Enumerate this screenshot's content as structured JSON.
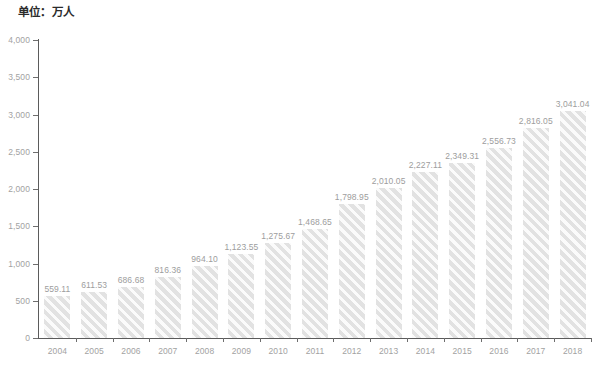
{
  "chart_data": {
    "type": "bar",
    "title": "单位：万人",
    "xlabel": "",
    "ylabel": "",
    "ylim": [
      0,
      4000
    ],
    "ytick_labels": [
      "4,000",
      "3,500",
      "3,000",
      "2,500",
      "2,000",
      "1,500",
      "1,000",
      "500",
      "0"
    ],
    "ytick_values": [
      4000,
      3500,
      3000,
      2500,
      2000,
      1500,
      1000,
      500,
      0
    ],
    "grid": false,
    "legend": null,
    "categories": [
      "2004",
      "2005",
      "2006",
      "2007",
      "2008",
      "2009",
      "2010",
      "2011",
      "2012",
      "2013",
      "2014",
      "2015",
      "2016",
      "2017",
      "2018"
    ],
    "values": [
      559.11,
      611.53,
      686.68,
      816.36,
      964.1,
      1123.55,
      1275.67,
      1468.65,
      1798.95,
      2010.05,
      2227.11,
      2349.31,
      2556.73,
      2816.05,
      3041.04
    ],
    "value_labels": [
      "559.11",
      "611.53",
      "686.68",
      "816.36",
      "964.10",
      "1,123.55",
      "1,275.67",
      "1,468.65",
      "1,798.95",
      "2,010.05",
      "2,227.11",
      "2,349.31",
      "2,556.73",
      "2,816.05",
      "3,041.04"
    ],
    "bar_color": "#e2e2e2",
    "bar_pattern": "diagonal-hatch",
    "axis_color": "#5b5b5b",
    "label_color": "#a2a2a2"
  }
}
